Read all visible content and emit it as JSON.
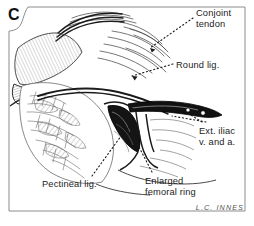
{
  "figure": {
    "panel_letter": "C",
    "signature": "L.C. INNES",
    "border_color": "#8c8c8c",
    "ink_color": "#1b1b1b",
    "background": "#ffffff"
  },
  "labels": [
    {
      "id": "conjoint-tendon",
      "text": "Conjoint\ntendon",
      "x": 196,
      "y": 8,
      "name": "label-conjoint-tendon"
    },
    {
      "id": "round-lig",
      "text": "Round lig.",
      "x": 176,
      "y": 60,
      "name": "label-round-lig"
    },
    {
      "id": "ext-iliac",
      "text": "Ext. iliac\nv. and a.",
      "x": 199,
      "y": 126,
      "name": "label-ext-iliac"
    },
    {
      "id": "pectineal-lig",
      "text": "Pectineal lig.",
      "x": 42,
      "y": 179,
      "name": "label-pectineal-lig"
    },
    {
      "id": "enlarged-ring",
      "text": "Enlarged\nfemoral ring",
      "x": 145,
      "y": 176,
      "name": "label-enlarged-femoral-ring"
    }
  ],
  "anatomy": {
    "structures": [
      "conjoint tendon",
      "round ligament",
      "external iliac vein and artery",
      "pectineal ligament",
      "enlarged femoral ring",
      "inguinal tissue flap"
    ]
  }
}
